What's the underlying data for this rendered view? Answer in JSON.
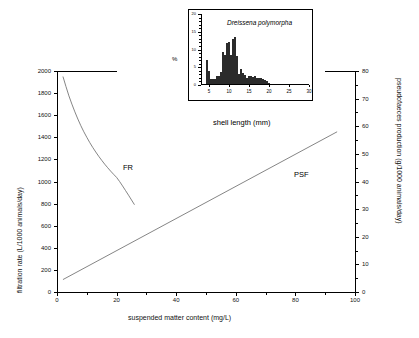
{
  "chart_data": [
    {
      "type": "line",
      "title": "",
      "xlabel": "suspended matter content (mg/L)",
      "ylabel_left": "filtration rate (L/1000 animals/day)",
      "ylabel_right": "pseudofaeces production (g/1000 animals/day)",
      "xlim": [
        0,
        100
      ],
      "ylim_left": [
        0,
        2000
      ],
      "ylim_right": [
        0,
        80
      ],
      "xticks": [
        0,
        20,
        40,
        60,
        80,
        100
      ],
      "xticks_minor": [
        10,
        30,
        50,
        70,
        90
      ],
      "yticks_left": [
        0,
        200,
        400,
        600,
        800,
        1000,
        1200,
        1400,
        1600,
        1800,
        2000
      ],
      "yticks_right": [
        0,
        10,
        20,
        30,
        40,
        50,
        60,
        70,
        80
      ],
      "grid": "off",
      "legend": "inline-annotations",
      "series": [
        {
          "name": "FR",
          "label": "FR",
          "axis": "left",
          "description": "filtration rate, decaying curve",
          "x": [
            2,
            3,
            4,
            5,
            6,
            7,
            8,
            9,
            10,
            11,
            12,
            13,
            14,
            15,
            16,
            17,
            18,
            19,
            20,
            21,
            22,
            23,
            24,
            25,
            26
          ],
          "y": [
            1950,
            1860,
            1775,
            1700,
            1630,
            1565,
            1505,
            1450,
            1400,
            1352,
            1308,
            1267,
            1228,
            1192,
            1157,
            1125,
            1094,
            1065,
            1037,
            1000,
            960,
            918,
            876,
            833,
            790
          ]
        },
        {
          "name": "PSF",
          "label": "PSF",
          "axis": "right",
          "description": "pseudofaeces production, linear increase",
          "x": [
            2,
            94
          ],
          "y": [
            4.5,
            58
          ]
        }
      ]
    },
    {
      "type": "bar",
      "title": "Dreissena polymorpha",
      "xlabel": "shell length (mm)",
      "ylabel": "%",
      "xlim": [
        3,
        30
      ],
      "ylim": [
        0,
        20
      ],
      "xticks": [
        5,
        10,
        15,
        20,
        25,
        30
      ],
      "yticks": [
        0,
        5,
        10,
        15,
        20
      ],
      "grid": "off",
      "categories": [
        4.5,
        5.0,
        5.5,
        6.0,
        6.5,
        7.0,
        7.5,
        8.0,
        8.5,
        9.0,
        9.5,
        10.0,
        10.5,
        11.0,
        11.5,
        12.0,
        12.5,
        13.0,
        13.5,
        14.0,
        14.5,
        15.0,
        15.5,
        16.0,
        16.5,
        17.0,
        17.5,
        18.0,
        18.5,
        19.0,
        19.5,
        20.0,
        20.5,
        21.0,
        21.5,
        22.0,
        22.5,
        23.0,
        23.5,
        24.0,
        24.5,
        25.0,
        25.5,
        26.0,
        26.5,
        27.0,
        27.5,
        28.0
      ],
      "values": [
        7.0,
        4.0,
        1.6,
        1.6,
        1.7,
        2.5,
        2.6,
        3.6,
        9.2,
        8.4,
        11.7,
        12.0,
        8.5,
        12.9,
        13.4,
        8.2,
        3.1,
        4.5,
        3.4,
        2.8,
        2.0,
        2.6,
        2.5,
        2.3,
        2.4,
        2.0,
        2.1,
        2.1,
        1.6,
        1.4,
        1.0,
        0.5,
        0.4,
        0.4,
        0.3,
        0.3,
        0.2,
        0.2
      ]
    }
  ],
  "main": {
    "x_axis": {
      "title": "suspended matter content (mg/L)",
      "labels": [
        "0",
        "20",
        "40",
        "60",
        "80",
        "100"
      ]
    },
    "y_axis_left": {
      "title": "filtration rate (L/1000 animals/day)",
      "labels": [
        "0",
        "200",
        "400",
        "600",
        "800",
        "1000",
        "1200",
        "1400",
        "1600",
        "1800",
        "2000"
      ]
    },
    "y_axis_right": {
      "title": "pseudofaeces production (g/1000 animals/day)",
      "labels": [
        "0",
        "10",
        "20",
        "30",
        "40",
        "50",
        "60",
        "70",
        "80"
      ]
    },
    "annotations": {
      "fr": "FR",
      "psf": "PSF"
    }
  },
  "inset": {
    "species": "Dreissena polymorpha",
    "x_axis": {
      "title": "shell length (mm)",
      "labels": [
        "5",
        "10",
        "15",
        "20",
        "25",
        "30"
      ]
    },
    "y_axis": {
      "title": "%",
      "labels": [
        "0",
        "5",
        "10",
        "15",
        "20"
      ]
    }
  },
  "colors": {
    "axis": "#000000",
    "curve": "#555555",
    "bar_fill": "#2b2b2b",
    "background": "#ffffff"
  }
}
